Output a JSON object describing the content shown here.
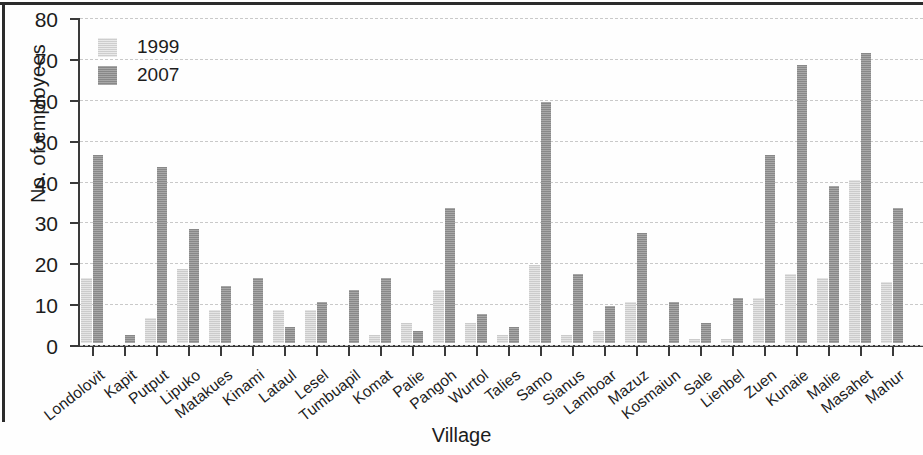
{
  "chart_data": {
    "type": "bar",
    "title": "",
    "xlabel": "Village",
    "ylabel": "No. of employees",
    "ylim": [
      0,
      80
    ],
    "ytick_values": [
      0,
      10,
      20,
      30,
      40,
      50,
      60,
      70,
      80
    ],
    "ytick_labels": [
      "0",
      "10",
      "20",
      "30",
      "40",
      "50",
      "60",
      "70",
      "80"
    ],
    "grid": true,
    "legend_position": "top-left",
    "categories": [
      "Londolovit",
      "Kapit",
      "Putput",
      "Lipuko",
      "Matakues",
      "Kinami",
      "Lataul",
      "Lesel",
      "Tumbuapil",
      "Komat",
      "Palie",
      "Pangoh",
      "Wurtol",
      "Talies",
      "Samo",
      "Sianus",
      "Lamboar",
      "Mazuz",
      "Kosmaiun",
      "Sale",
      "Lienbel",
      "Zuen",
      "Kunaie",
      "Malie",
      "Masahet",
      "Mahur"
    ],
    "series": [
      {
        "name": "1999",
        "color": "#cfcfcf",
        "values": [
          16,
          0,
          6,
          18,
          8,
          0,
          8,
          8,
          0,
          2,
          5,
          13,
          5,
          2,
          19,
          2,
          3,
          10,
          0,
          1,
          1,
          11,
          17,
          16,
          40,
          15
        ]
      },
      {
        "name": "2007",
        "color": "#8f8f8f",
        "values": [
          46,
          2,
          43,
          28,
          14,
          16,
          4,
          10,
          13,
          16,
          3,
          33,
          7,
          4,
          59,
          17,
          9,
          27,
          10,
          5,
          11,
          46,
          68,
          38.5,
          71,
          33
        ]
      }
    ]
  },
  "legend": {
    "entries": [
      {
        "label": "1999"
      },
      {
        "label": "2007"
      }
    ]
  },
  "axes": {
    "y_title": "No. of employees",
    "x_title": "Village"
  }
}
